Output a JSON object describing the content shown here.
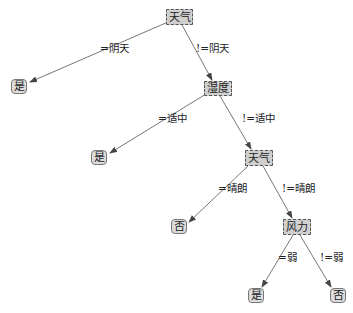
{
  "diagram": {
    "type": "decision-tree",
    "nodes": [
      {
        "id": "n0",
        "label": "天气",
        "kind": "decision",
        "x": 166,
        "y": 9,
        "w": 27,
        "h": 16
      },
      {
        "id": "n1",
        "label": "是",
        "kind": "leaf",
        "x": 11,
        "y": 79,
        "w": 16,
        "h": 15
      },
      {
        "id": "n2",
        "label": "湿度",
        "kind": "decision",
        "x": 204,
        "y": 81,
        "w": 28,
        "h": 15
      },
      {
        "id": "n3",
        "label": "是",
        "kind": "leaf",
        "x": 91,
        "y": 150,
        "w": 16,
        "h": 15
      },
      {
        "id": "n4",
        "label": "天气",
        "kind": "decision",
        "x": 245,
        "y": 150,
        "w": 28,
        "h": 16
      },
      {
        "id": "n5",
        "label": "否",
        "kind": "leaf",
        "x": 171,
        "y": 219,
        "w": 16,
        "h": 15
      },
      {
        "id": "n6",
        "label": "风力",
        "kind": "decision",
        "x": 283,
        "y": 219,
        "w": 28,
        "h": 16
      },
      {
        "id": "n7",
        "label": "是",
        "kind": "leaf",
        "x": 248,
        "y": 288,
        "w": 16,
        "h": 15
      },
      {
        "id": "n8",
        "label": "否",
        "kind": "leaf",
        "x": 330,
        "y": 288,
        "w": 16,
        "h": 15
      }
    ],
    "edges": [
      {
        "from": "n0",
        "to": "n1",
        "label": "=阴天",
        "x1": 168,
        "y1": 22,
        "x2": 30,
        "y2": 82,
        "lx": 100,
        "ly": 43
      },
      {
        "from": "n0",
        "to": "n2",
        "label": "!=阴天",
        "x1": 182,
        "y1": 25,
        "x2": 212,
        "y2": 80,
        "lx": 196,
        "ly": 43
      },
      {
        "from": "n2",
        "to": "n3",
        "label": "=适中",
        "x1": 206,
        "y1": 94,
        "x2": 110,
        "y2": 153,
        "lx": 158,
        "ly": 113
      },
      {
        "from": "n2",
        "to": "n4",
        "label": "!=适中",
        "x1": 220,
        "y1": 96,
        "x2": 251,
        "y2": 149,
        "lx": 242,
        "ly": 113
      },
      {
        "from": "n4",
        "to": "n5",
        "label": "=晴朗",
        "x1": 248,
        "y1": 166,
        "x2": 189,
        "y2": 222,
        "lx": 218,
        "ly": 183
      },
      {
        "from": "n4",
        "to": "n6",
        "label": "!=晴朗",
        "x1": 263,
        "y1": 166,
        "x2": 292,
        "y2": 218,
        "lx": 282,
        "ly": 183
      },
      {
        "from": "n6",
        "to": "n7",
        "label": "=弱",
        "x1": 293,
        "y1": 235,
        "x2": 262,
        "y2": 287,
        "lx": 278,
        "ly": 252
      },
      {
        "from": "n6",
        "to": "n8",
        "label": "!=弱",
        "x1": 300,
        "y1": 235,
        "x2": 331,
        "y2": 287,
        "lx": 320,
        "ly": 252
      }
    ],
    "colors": {
      "edge": "#666666",
      "decision_fill": "#cfcfcf",
      "leaf_fill": "#dcdcdc"
    }
  }
}
